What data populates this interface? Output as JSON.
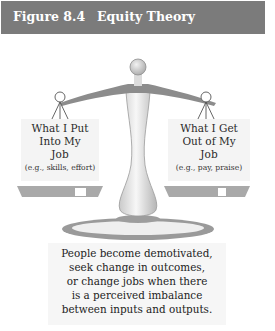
{
  "header": {
    "figure_number": "Figure 8.4",
    "title": "Equity Theory",
    "background_color": "#7b7b7b"
  },
  "diagram": {
    "type": "balance-scale",
    "left_pan": {
      "title_lines": [
        "What I Put",
        "Into My",
        "Job"
      ],
      "examples": "(e.g., skills, effort)"
    },
    "right_pan": {
      "title_lines": [
        "What I Get",
        "Out of My",
        "Job"
      ],
      "examples": "(e.g., pay, praise)"
    }
  },
  "caption": {
    "lines": [
      "People become demotivated,",
      "seek change in outcomes,",
      "or change jobs when there",
      "is a perceived imbalance",
      "between inputs and outputs."
    ]
  }
}
